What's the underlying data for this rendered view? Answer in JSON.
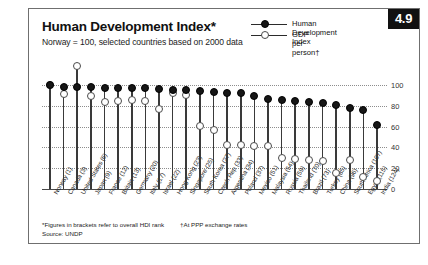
{
  "badge": {
    "number": "4.9"
  },
  "header": {
    "title": "Human Development Index*",
    "subtitle": "Norway = 100, selected countries based on 2000 data"
  },
  "legend": {
    "items": [
      {
        "label": "Human Development Index",
        "marker": "filled-circle"
      },
      {
        "label": "GDP per person†",
        "marker": "open-circle"
      }
    ]
  },
  "footnote": {
    "brackets": "*Figures in brackets refer to overall HDI rank",
    "ppp": "†At PPP exchange rates",
    "source": "Source: UNDP"
  },
  "chart_data": {
    "type": "scatter",
    "title": "Human Development Index*",
    "subtitle": "Norway = 100, selected countries based on 2000 data",
    "xlabel": "",
    "ylabel": "",
    "ylim": [
      0,
      100
    ],
    "yticks": [
      0,
      20,
      40,
      60,
      80,
      100
    ],
    "grid": true,
    "legend_position": "top-right",
    "categories": [
      "Norway (1)",
      "Canada (3)",
      "United States (6)",
      "Japan (9)",
      "France (12)",
      "Britain (13)",
      "Germany (20)",
      "Italy (17)",
      "Israel (22)",
      "Hong Kong (23)",
      "Singapore (25)",
      "South Korea (27)",
      "Czech Rep (33)",
      "Argentina (34)",
      "Poland (37)",
      "Mexico (51)",
      "Malaysia (54)",
      "Russia (59)",
      "Thailand (70)",
      "Brazil (73)",
      "Turkey (85)",
      "China (96)",
      "South Africa (107)",
      "Egypt (115)",
      "India (124)"
    ],
    "series": [
      {
        "name": "Human Development Index",
        "values": [
          100,
          98,
          98,
          98,
          97,
          97,
          97,
          97,
          96,
          95,
          95,
          94,
          93,
          92,
          92,
          89,
          87,
          86,
          85,
          84,
          83,
          81,
          78,
          76,
          62
        ]
      },
      {
        "name": "GDP per person†",
        "values": [
          100,
          91,
          118,
          89,
          84,
          85,
          86,
          85,
          77,
          92,
          90,
          61,
          57,
          42,
          42,
          41,
          41,
          30,
          29,
          28,
          27,
          15,
          28,
          12,
          8
        ]
      }
    ]
  }
}
